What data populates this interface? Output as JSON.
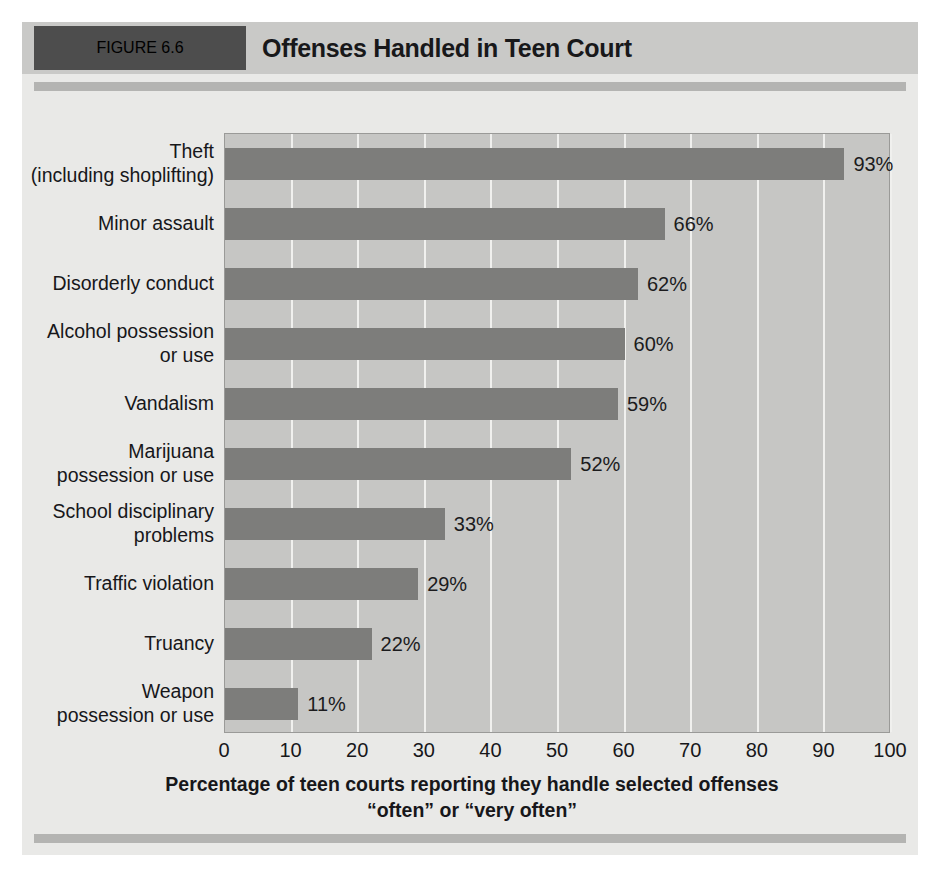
{
  "figure": {
    "badge_label": "FIGURE 6.6",
    "title": "Offenses Handled in Teen Court"
  },
  "colors": {
    "badge_background": "#4d4d4d",
    "badge_text": "#ffffff",
    "header_background": "#c9c9c7",
    "figure_background": "#e9e9e7",
    "plot_background": "#c6c6c4",
    "gridline": "#f0f0ee",
    "bar_fill": "#7d7d7b",
    "rule": "#b4b4b2",
    "text": "#17171a"
  },
  "chart_data": {
    "type": "bar",
    "orientation": "horizontal",
    "title": "Offenses Handled in Teen Court",
    "xlabel": "Percentage of teen courts reporting they handle selected offenses “often” or “very often”",
    "xlabel_line1": "Percentage of teen courts reporting they handle selected offenses",
    "xlabel_line2": "“often” or “very often”",
    "ylabel": "",
    "xlim": [
      0,
      100
    ],
    "xticks": [
      "0",
      "10",
      "20",
      "30",
      "40",
      "50",
      "60",
      "70",
      "80",
      "90",
      "100"
    ],
    "grid": "vertical",
    "legend": "none",
    "categories": [
      "Theft\n(including shoplifting)",
      "Minor assault",
      "Disorderly conduct",
      "Alcohol possession\nor use",
      "Vandalism",
      "Marijuana\npossession or use",
      "School disciplinary\nproblems",
      "Traffic violation",
      "Truancy",
      "Weapon\npossession or use"
    ],
    "category_lines": [
      [
        "Theft",
        "(including shoplifting)"
      ],
      [
        "Minor assault"
      ],
      [
        "Disorderly conduct"
      ],
      [
        "Alcohol possession",
        "or use"
      ],
      [
        "Vandalism"
      ],
      [
        "Marijuana",
        "possession or use"
      ],
      [
        "School disciplinary",
        "problems"
      ],
      [
        "Traffic violation"
      ],
      [
        "Truancy"
      ],
      [
        "Weapon",
        "possession or use"
      ]
    ],
    "values": [
      93,
      66,
      62,
      60,
      59,
      52,
      33,
      29,
      22,
      11
    ],
    "value_labels": [
      "93%",
      "66%",
      "62%",
      "60%",
      "59%",
      "52%",
      "33%",
      "29%",
      "22%",
      "11%"
    ]
  }
}
